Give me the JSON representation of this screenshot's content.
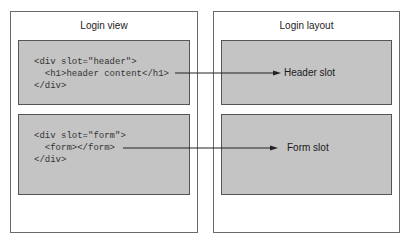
{
  "left_panel": {
    "title": "Login view",
    "blocks": [
      {
        "lines": [
          "<div slot=\"header\">",
          "  <h1>header content</h1>",
          "</div>"
        ]
      },
      {
        "lines": [
          "<div slot=\"form\">",
          "  <form></form>",
          "</div>"
        ]
      }
    ]
  },
  "right_panel": {
    "title": "Login layout",
    "slots": [
      {
        "label": "Header slot"
      },
      {
        "label": "Form slot"
      }
    ]
  },
  "colors": {
    "box_fill": "#c4c4c4",
    "border": "#555555",
    "arrow": "#222222"
  }
}
